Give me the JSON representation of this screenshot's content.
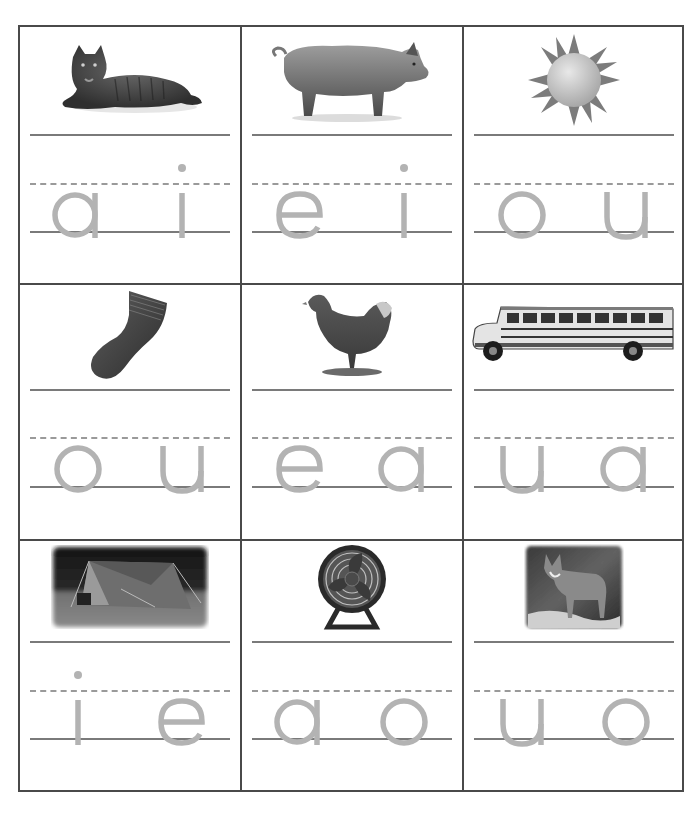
{
  "worksheet": {
    "title": "Short vowel picture choice",
    "colors": {
      "border": "#4a4a4a",
      "guide_line": "#7a7a7a",
      "dashed_line": "#9a9a9a",
      "letter": "#b3b3b3"
    },
    "cells": [
      {
        "picture": "cat",
        "icon": "cat-image",
        "choices": [
          "a",
          "i"
        ]
      },
      {
        "picture": "pig",
        "icon": "pig-image",
        "choices": [
          "e",
          "i"
        ]
      },
      {
        "picture": "sun",
        "icon": "sun-image",
        "choices": [
          "o",
          "u"
        ]
      },
      {
        "picture": "sock",
        "icon": "sock-image",
        "choices": [
          "o",
          "u"
        ]
      },
      {
        "picture": "hen",
        "icon": "hen-image",
        "choices": [
          "e",
          "a"
        ]
      },
      {
        "picture": "bus",
        "icon": "bus-image",
        "choices": [
          "u",
          "a"
        ]
      },
      {
        "picture": "tent",
        "icon": "tent-image",
        "choices": [
          "i",
          "e"
        ]
      },
      {
        "picture": "fan",
        "icon": "fan-image",
        "choices": [
          "a",
          "o"
        ]
      },
      {
        "picture": "fox",
        "icon": "fox-image",
        "choices": [
          "u",
          "o"
        ]
      }
    ]
  }
}
